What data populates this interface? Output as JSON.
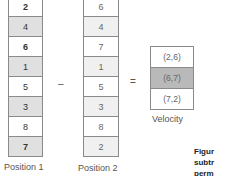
{
  "position1": {
    "label": "Position 1",
    "cells": [
      "2",
      "4",
      "6",
      "1",
      "5",
      "3",
      "8",
      "7"
    ]
  },
  "position2": {
    "label": "Position 2",
    "cells": [
      "6",
      "4",
      "7",
      "1",
      "5",
      "3",
      "8",
      "2"
    ]
  },
  "velocity": {
    "label": "Velocity",
    "cells": [
      "(2,6)",
      "(6,7)",
      "(7,2)"
    ]
  },
  "operators": {
    "minus": "–",
    "equals": "="
  },
  "caption": {
    "line1": "Figur",
    "line2": "subtr",
    "line3": "perm"
  }
}
